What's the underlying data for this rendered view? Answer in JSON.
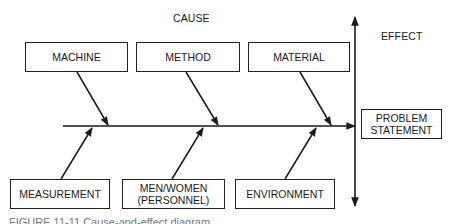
{
  "diagram": {
    "type": "fishbone",
    "cause_label": "CAUSE",
    "effect_label": "EFFECT",
    "effect_box": {
      "line1": "PROBLEM",
      "line2": "STATEMENT"
    },
    "top_causes": [
      {
        "label": "MACHINE"
      },
      {
        "label": "METHOD"
      },
      {
        "label": "MATERIAL"
      }
    ],
    "bottom_causes": [
      {
        "label": "MEASUREMENT"
      },
      {
        "line1": "MEN/WOMEN",
        "line2": "(PERSONNEL)"
      },
      {
        "label": "ENVIRONMENT"
      }
    ],
    "caption": "FIGURE 11-11   Cause-and-effect diagram."
  }
}
